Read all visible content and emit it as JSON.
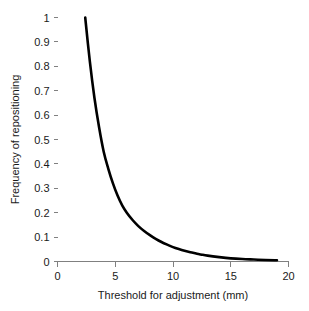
{
  "chart_data": {
    "type": "line",
    "title": "",
    "subtitle": "",
    "xlabel": "Threshold for adjustment (mm)",
    "ylabel": "Frequency of repositioning",
    "xlim": [
      0,
      20
    ],
    "ylim": [
      0,
      1
    ],
    "grid": false,
    "legend": null,
    "legend_position": "none",
    "line_color": "#000000",
    "xticks": [
      0,
      5,
      10,
      15,
      20
    ],
    "xticklabels": [
      "0",
      "5",
      "10",
      "15",
      "20"
    ],
    "yticks": [
      0,
      0.1,
      0.2,
      0.3,
      0.4,
      0.5,
      0.6,
      0.7,
      0.8,
      0.9,
      1
    ],
    "yticklabels": [
      "0",
      "0.1",
      "0.2",
      "0.3",
      "0.4",
      "0.5",
      "0.6",
      "0.7",
      "0.8",
      "0.9",
      "1"
    ],
    "series": [
      {
        "name": "Frequency of repositioning",
        "x": [
          2.4,
          2.8,
          3.2,
          3.6,
          4.0,
          4.4,
          4.8,
          5.2,
          5.6,
          6.0,
          6.5,
          7.0,
          7.5,
          8.0,
          8.5,
          9.0,
          9.5,
          10.0,
          10.5,
          11.0,
          11.5,
          12.0,
          12.5,
          13.0,
          14.0,
          15.0,
          16.0,
          17.0,
          18.0,
          19.0
        ],
        "y": [
          1.0,
          0.82,
          0.67,
          0.55,
          0.45,
          0.38,
          0.32,
          0.27,
          0.23,
          0.2,
          0.17,
          0.145,
          0.125,
          0.108,
          0.093,
          0.08,
          0.069,
          0.059,
          0.051,
          0.044,
          0.038,
          0.033,
          0.028,
          0.024,
          0.018,
          0.013,
          0.01,
          0.008,
          0.006,
          0.005
        ]
      }
    ]
  },
  "axes": {
    "x_title": "Threshold for adjustment (mm)",
    "y_title": "Frequency of repositioning"
  }
}
